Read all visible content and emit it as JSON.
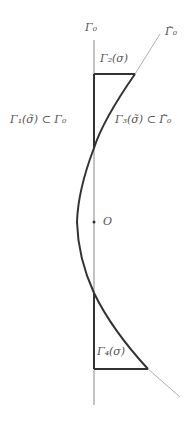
{
  "labels": {
    "gamma0_axis": "Γ₀",
    "gamma0_tilde_axis": "Γ̃₀",
    "gamma2": "Γ₂(σ)",
    "gamma1": "Γ₁(σ̃) ⊂ Γ₀",
    "gamma3": "Γ₃(σ̃) ⊂ Γ̃₀",
    "origin": "O",
    "gamma4": "Γ₄(σ)"
  },
  "colors": {
    "thick_line": "#333333",
    "thin_line": "#888888",
    "text": "#555555"
  }
}
